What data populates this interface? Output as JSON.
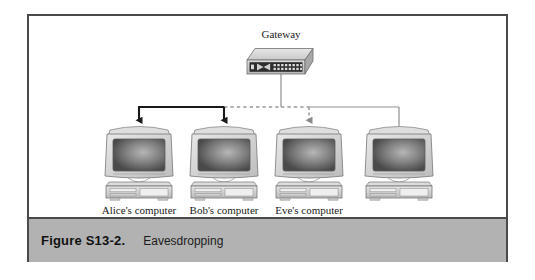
{
  "figure": {
    "caption_number": "Figure S13-2.",
    "caption_title": "Eavesdropping"
  },
  "colors": {
    "frame_border": "#4a4a4a",
    "caption_bar_bg": "#b2b2b2",
    "active_link": "#1a1a1a",
    "passive_link": "#9a9a9a",
    "tap_link": "#8a8a8a",
    "device_body": "#d4d4d4",
    "screen_dark": "#4e4e4e",
    "canvas_bg": "#ffffff"
  },
  "diagram": {
    "type": "network-bus-eavesdropping",
    "gateway": {
      "label": "Gateway",
      "icon": "router-switch-icon",
      "ports_rows": 2,
      "ports_cols": 8
    },
    "bus": {
      "y": 91,
      "segments": [
        {
          "name": "alice-to-bob",
          "style": "solid-thick-black",
          "from_x": 137,
          "to_x": 222
        },
        {
          "name": "bob-to-gateway-tap",
          "style": "dashed-gray",
          "from_x": 222,
          "to_x": 307
        },
        {
          "name": "gateway-drop-to-right",
          "style": "solid-thin-gray",
          "from_x": 307,
          "to_x": 397
        }
      ]
    },
    "nodes": [
      {
        "id": "alice",
        "label": "Alice's computer",
        "icon": "desktop-computer-icon",
        "x": 137,
        "link_style": "solid-thick-black",
        "arrow": true
      },
      {
        "id": "bob",
        "label": "Bob's computer",
        "icon": "desktop-computer-icon",
        "x": 222,
        "link_style": "solid-thick-black",
        "arrow": true
      },
      {
        "id": "eve",
        "label": "Eve's computer",
        "icon": "desktop-computer-icon",
        "x": 307,
        "link_style": "dashed-gray",
        "arrow": true
      },
      {
        "id": "node4",
        "label": "",
        "icon": "desktop-computer-icon",
        "x": 397,
        "link_style": "solid-thin-gray",
        "arrow": false
      }
    ]
  }
}
